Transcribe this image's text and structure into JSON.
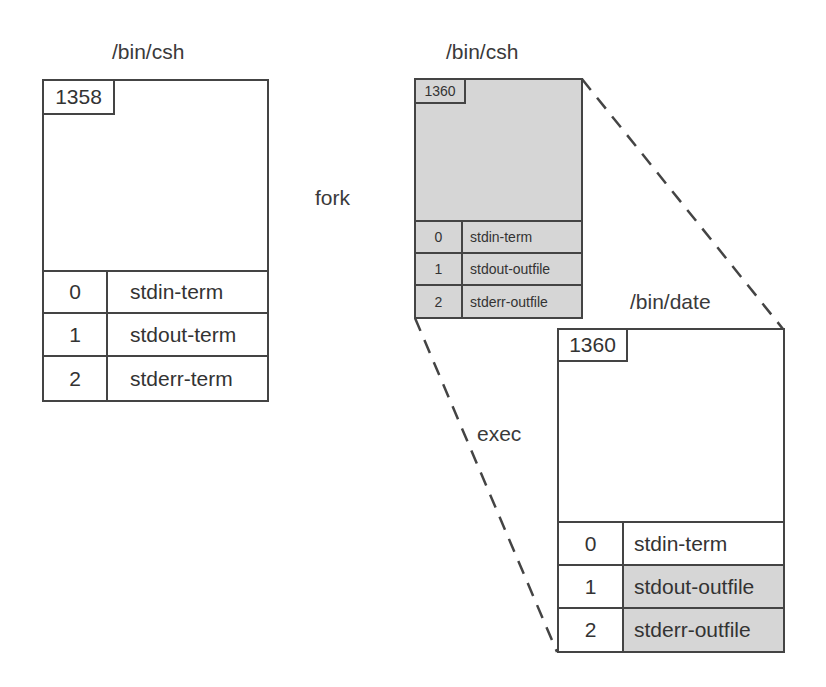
{
  "diagram": {
    "type": "process-fork-exec",
    "operations": {
      "fork": "fork",
      "exec": "exec"
    },
    "processes": [
      {
        "id": "parent-shell",
        "program": "/bin/csh",
        "pid": "1358",
        "shaded": false,
        "fds": [
          {
            "fd": "0",
            "target": "stdin-term",
            "shaded": false
          },
          {
            "fd": "1",
            "target": "stdout-term",
            "shaded": false
          },
          {
            "fd": "2",
            "target": "stderr-term",
            "shaded": false
          }
        ]
      },
      {
        "id": "forked-child",
        "program": "/bin/csh",
        "pid": "1360",
        "shaded": true,
        "fds": [
          {
            "fd": "0",
            "target": "stdin-term",
            "shaded": true
          },
          {
            "fd": "1",
            "target": "stdout-outfile",
            "shaded": true
          },
          {
            "fd": "2",
            "target": "stderr-outfile",
            "shaded": true
          }
        ]
      },
      {
        "id": "exec-child",
        "program": "/bin/date",
        "pid": "1360",
        "shaded": false,
        "fds": [
          {
            "fd": "0",
            "target": "stdin-term",
            "shaded": false
          },
          {
            "fd": "1",
            "target": "stdout-outfile",
            "shaded": true
          },
          {
            "fd": "2",
            "target": "stderr-outfile",
            "shaded": true
          }
        ]
      }
    ],
    "colors": {
      "line": "#444444",
      "shade": "#d6d6d6",
      "text": "#333333"
    }
  }
}
